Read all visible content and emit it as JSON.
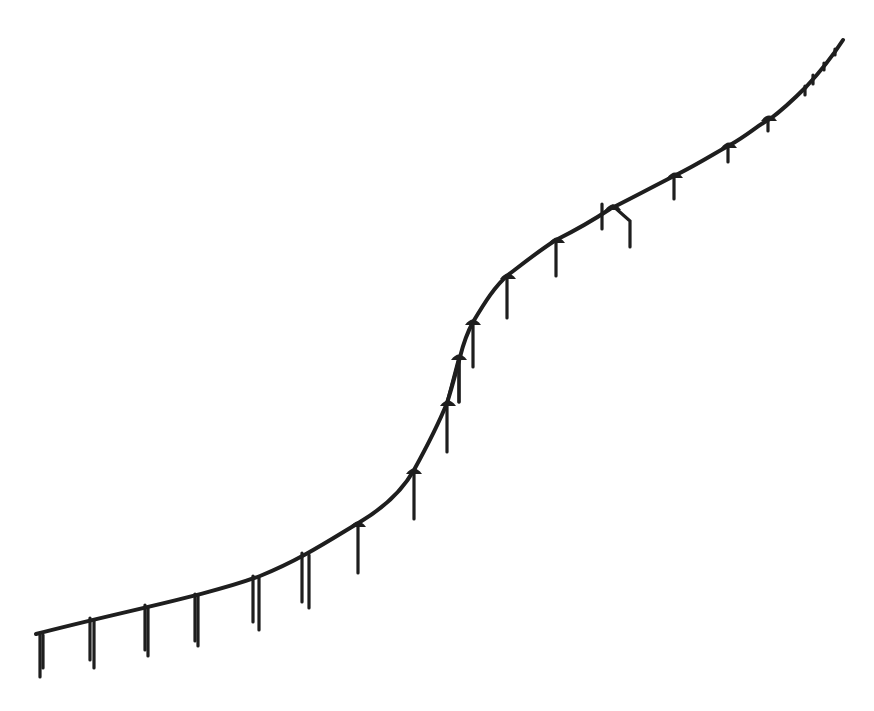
{
  "diagram": {
    "type": "line-sketch",
    "colors": {
      "stroke": "#1e1e1e",
      "background": "#ffffff"
    },
    "main_path": "M 36 634 C 120 612, 210 595, 260 576 C 300 560, 330 540, 360 522 C 390 504, 405 486, 414 470 C 425 450, 438 425, 447 403 C 452 388, 456 372, 460 357 C 463 345, 467 333, 473 322 C 485 302, 495 286, 508 275 C 525 262, 540 250, 556 240 C 580 228, 595 219, 610 209 C 640 194, 660 183, 676 175 C 700 163, 715 153, 730 145 C 748 135, 758 125, 770 119 C 785 108, 795 98, 806 87 C 820 72, 832 57, 843 40",
    "posts": [
      {
        "x": 40,
        "top": 633,
        "bottom": 677,
        "double": true,
        "x2": 43,
        "bottom2": 668
      },
      {
        "x": 90,
        "top": 618,
        "bottom": 660,
        "double": true,
        "x2": 94,
        "bottom2": 668
      },
      {
        "x": 145,
        "top": 605,
        "bottom": 650,
        "double": true,
        "x2": 148,
        "bottom2": 656
      },
      {
        "x": 195,
        "top": 594,
        "bottom": 641,
        "double": true,
        "x2": 198,
        "bottom2": 646
      },
      {
        "x": 253,
        "top": 576,
        "bottom": 622,
        "double": true,
        "x2": 259,
        "bottom2": 630
      },
      {
        "x": 302,
        "top": 553,
        "bottom": 602,
        "double": true,
        "x2": 309,
        "bottom2": 608
      },
      {
        "x": 358,
        "top": 524,
        "bottom": 573,
        "double": false
      },
      {
        "x": 414,
        "top": 472,
        "bottom": 519,
        "double": false
      },
      {
        "x": 447,
        "top": 404,
        "bottom": 452,
        "double": false
      },
      {
        "x": 459,
        "top": 358,
        "bottom": 402,
        "double": false
      },
      {
        "x": 473,
        "top": 322,
        "bottom": 367,
        "double": false
      },
      {
        "x": 507,
        "top": 276,
        "bottom": 318,
        "double": false
      },
      {
        "x": 556,
        "top": 240,
        "bottom": 276,
        "double": false
      },
      {
        "x": 602,
        "top": 204,
        "bottom": 229,
        "double": false
      },
      {
        "x": 674,
        "top": 176,
        "bottom": 199,
        "double": false
      },
      {
        "x": 728,
        "top": 146,
        "bottom": 162,
        "double": false
      },
      {
        "x": 768,
        "top": 118,
        "bottom": 131,
        "double": false
      },
      {
        "x": 805,
        "top": 86,
        "bottom": 95,
        "double": false
      },
      {
        "x": 813,
        "top": 75,
        "bottom": 84,
        "double": false
      },
      {
        "x": 824,
        "top": 63,
        "bottom": 70,
        "double": false
      },
      {
        "x": 835,
        "top": 49,
        "bottom": 55,
        "double": false
      }
    ],
    "caps": [
      {
        "x": 358,
        "y": 524
      },
      {
        "x": 414,
        "y": 471
      },
      {
        "x": 448,
        "y": 403
      },
      {
        "x": 459,
        "y": 357
      },
      {
        "x": 473,
        "y": 322
      },
      {
        "x": 508,
        "y": 276
      },
      {
        "x": 557,
        "y": 240
      },
      {
        "x": 613,
        "y": 207
      },
      {
        "x": 675,
        "y": 175
      },
      {
        "x": 729,
        "y": 145
      },
      {
        "x": 769,
        "y": 118
      }
    ],
    "brace": {
      "description": "Inclined strut between caps at the steep section",
      "from": {
        "x": 447,
        "y": 403
      },
      "to": {
        "x": 459,
        "y": 357
      },
      "return": {
        "x": 459,
        "y": 402
      }
    },
    "bent_post": {
      "description": "Angled post descending from cap near x=613",
      "points": "613,206 630,221 630,247"
    }
  }
}
